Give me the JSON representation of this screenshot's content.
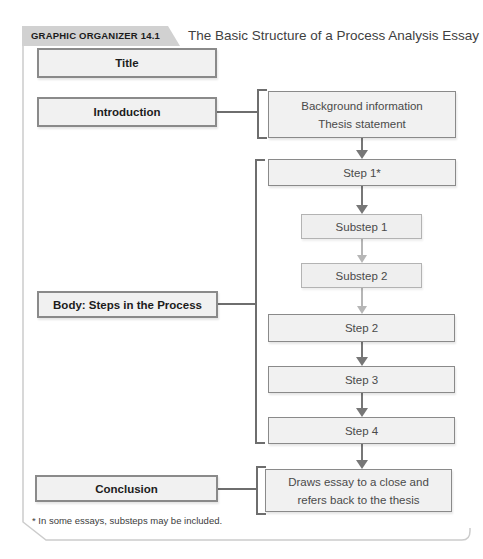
{
  "colors": {
    "box_fill": "#f1f1f1",
    "box_border": "#8a8a8a",
    "substep_border": "#b3b3b3",
    "connector_dark": "#777777",
    "connector_light": "#b6b6b6",
    "badge_bg": "#d1d1d1",
    "frame_border": "#cccccc"
  },
  "header": {
    "badge": "GRAPHIC ORGANIZER 14.1",
    "title": "The Basic Structure of a Process Analysis Essay"
  },
  "outline": {
    "title": "Title",
    "introduction": "Introduction",
    "body": "Body: Steps in the Process",
    "conclusion": "Conclusion"
  },
  "details": {
    "introduction": {
      "line1": "Background information",
      "line2": "Thesis statement"
    },
    "steps": {
      "step1": "Step 1*",
      "substep1": "Substep 1",
      "substep2": "Substep 2",
      "step2": "Step 2",
      "step3": "Step 3",
      "step4": "Step 4"
    },
    "conclusion": {
      "line1": "Draws essay to a close and",
      "line2": "refers back to the thesis"
    }
  },
  "footnote": "* In some essays, substeps may be included."
}
